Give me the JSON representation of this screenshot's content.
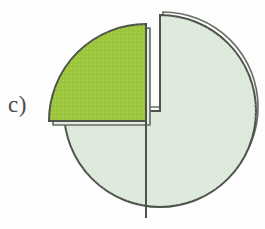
{
  "figure": {
    "label": "c)",
    "background_color": "#fdfdfd",
    "width": 265,
    "height": 229
  },
  "chart_data": {
    "type": "pie",
    "title": "",
    "subtitle": "",
    "xlabel": "",
    "ylabel": "",
    "exploded": true,
    "legend": "none",
    "grid": false,
    "annotations": [
      "c)"
    ],
    "categories": [
      "Remaining portion",
      "Exploded quarter"
    ],
    "values": [
      75,
      25
    ],
    "value_unit": "percent",
    "labels_visible": false,
    "slices": [
      {
        "name": "Remaining portion",
        "value": 75,
        "fraction": 0.75,
        "start_angle_deg": 0,
        "end_angle_deg": 270,
        "fill": "#deeadb",
        "stroke": "#4d544b",
        "exploded": false,
        "depth_shadow": true
      },
      {
        "name": "Exploded quarter",
        "value": 25,
        "fraction": 0.25,
        "start_angle_deg": 270,
        "end_angle_deg": 360,
        "fill": "#9cc63c",
        "stroke": "#4d544b",
        "exploded": true,
        "explode_offset_px": 14,
        "depth_shadow": true
      }
    ],
    "colors": {
      "pale_green": "#deeadb",
      "yellow_green": "#9cc63c",
      "outline": "#4d544b",
      "shadow_outline": "#5d6259",
      "label_text": "#4a4a4a",
      "background": "#fdfdfd"
    },
    "geometry": {
      "main_center_x": 160,
      "main_center_y": 111,
      "main_radius": 96,
      "slice_center_x": 146,
      "slice_center_y": 121,
      "slice_radius": 97
    }
  }
}
